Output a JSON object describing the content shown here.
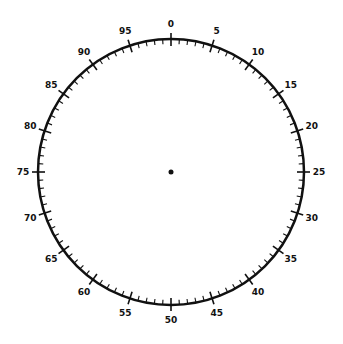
{
  "dial": {
    "center": [
      171,
      172
    ],
    "radius": 133,
    "scale_min": 0,
    "scale_max": 100,
    "major_step": 5,
    "minor_step": 1,
    "labels": [
      "0",
      "5",
      "10",
      "15",
      "20",
      "25",
      "30",
      "35",
      "40",
      "45",
      "50",
      "55",
      "60",
      "65",
      "70",
      "75",
      "80",
      "85",
      "90",
      "95"
    ],
    "color": "#111111"
  }
}
